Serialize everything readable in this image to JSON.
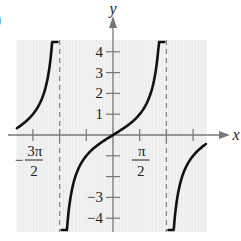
{
  "figure": {
    "part_label": ")"
  },
  "chart_data": {
    "type": "line",
    "title": "",
    "function": "y = tan(x/2)",
    "xlabel": "x",
    "ylabel": "y",
    "xlim_units_of_pi": [
      -3.6,
      3.5
    ],
    "ylim": [
      -4.6,
      4.6
    ],
    "grid": true,
    "x_ticks": [
      {
        "value_pi": -1.5,
        "label_num": "3π",
        "label_den": "2",
        "label_sign": "−",
        "labeled": true
      },
      {
        "value_pi": -1.0,
        "labeled": false
      },
      {
        "value_pi": -0.5,
        "labeled": false
      },
      {
        "value_pi": 0.5,
        "label_num": "π",
        "label_den": "2",
        "label_sign": "",
        "labeled": true
      },
      {
        "value_pi": 1.0,
        "labeled": false
      },
      {
        "value_pi": 1.5,
        "labeled": false
      }
    ],
    "y_ticks": [
      {
        "value": 4,
        "label": "4"
      },
      {
        "value": 3,
        "label": "3"
      },
      {
        "value": 2,
        "label": "2"
      },
      {
        "value": 1,
        "label": "1"
      },
      {
        "value": -1,
        "label": ""
      },
      {
        "value": -2,
        "label": ""
      },
      {
        "value": -3,
        "label": "−3"
      },
      {
        "value": -4,
        "label": "−4"
      }
    ],
    "asymptotes_pi": [
      -1,
      1
    ],
    "series": [
      {
        "name": "left-branch",
        "x_range_pi": [
          -1.8,
          -1.04
        ]
      },
      {
        "name": "middle-branch",
        "x_range_pi": [
          -0.96,
          0.96
        ]
      },
      {
        "name": "right-branch",
        "x_range_pi": [
          1.04,
          1.74
        ]
      }
    ],
    "colors": {
      "curve": "#111111",
      "axis": "#777777",
      "asymptote": "#888888",
      "grid_bg": "#f2f2f2",
      "grid_line": "#e4e4e4"
    }
  }
}
